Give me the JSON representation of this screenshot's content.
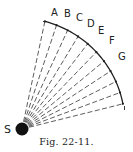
{
  "figure": {
    "caption": "Fig. 22-11.",
    "source_label": "S",
    "point_labels": [
      "A",
      "B",
      "C",
      "D",
      "E",
      "F",
      "G"
    ],
    "colors": {
      "ink": "#222222",
      "background": "#ffffff"
    }
  }
}
